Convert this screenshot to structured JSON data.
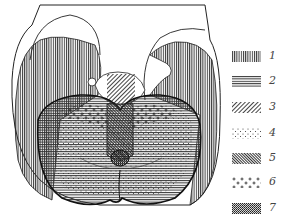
{
  "figure": {
    "colors": {
      "ink": "#222222",
      "background": "#ffffff",
      "label": "#444444"
    }
  },
  "legend": {
    "items": [
      {
        "label": "1",
        "pattern": "vertical-lines",
        "top": 51
      },
      {
        "label": "2",
        "pattern": "horizontal-lines",
        "top": 76
      },
      {
        "label": "3",
        "pattern": "diagonal-lines",
        "top": 102
      },
      {
        "label": "4",
        "pattern": "sparse-dots",
        "top": 128
      },
      {
        "label": "5",
        "pattern": "dense-diagonal",
        "top": 153
      },
      {
        "label": "6",
        "pattern": "crosses",
        "top": 177
      },
      {
        "label": "7",
        "pattern": "dense-crosshatch",
        "top": 203
      }
    ]
  }
}
